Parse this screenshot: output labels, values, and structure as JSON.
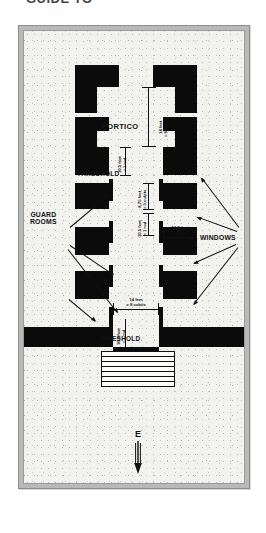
{
  "title": "GUIDE TO",
  "figure": {
    "orientation_letter": "E"
  },
  "labels": {
    "portico": "PORTICO",
    "threshold_upper": "THRESHOLD",
    "threshold_lower": "THRESHOLD",
    "guard_rooms": "GUARD\nROOMS",
    "guard_rooms_line1": "GUARD",
    "guard_rooms_line2": "ROOMS",
    "windows": "WINDOWS"
  },
  "dimensions": [
    {
      "id": "portico-width",
      "line1": "14 feet",
      "line2": "= 8 cubits",
      "orientation": "vertical"
    },
    {
      "id": "threshold-upper",
      "line1": "10.5 feet",
      "line2": "= 1 rod",
      "orientation": "vertical"
    },
    {
      "id": "guard-depth",
      "line1": "8.75 feet",
      "line2": "= 5 cubits",
      "orientation": "vertical"
    },
    {
      "id": "wall-gap",
      "line1": "10.5 feet",
      "line2": "= 1 rod",
      "orientation": "vertical"
    },
    {
      "id": "guard-width",
      "line1": "10.5 feet",
      "line2": "= 1 rod",
      "orientation": "horizontal"
    },
    {
      "id": "entry-width",
      "line1": "14 feet",
      "line2": "= 8 cubits",
      "orientation": "horizontal"
    },
    {
      "id": "threshold-lower",
      "line1": "10.5 feet",
      "line2": "= 1 rod",
      "orientation": "vertical"
    }
  ],
  "colors": {
    "wall": "#0b0b0b",
    "room": "#fbfbf8",
    "ground": "#f2f2ef",
    "frame": "#b9b9b9",
    "text": "#111111"
  }
}
